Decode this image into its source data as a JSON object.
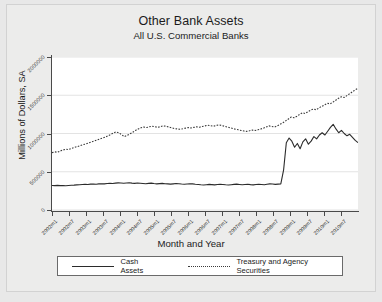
{
  "chart_data": {
    "type": "line",
    "title": "Other Bank Assets",
    "subtitle": "All U.S. Commercial Banks",
    "xlabel": "Month and Year",
    "ylabel": "Millions of Dollars, SA",
    "ylim": [
      0,
      2000000
    ],
    "ytick_labels": [
      "0",
      "500000",
      "1000000",
      "1500000",
      "2000000"
    ],
    "ytick_values": [
      0,
      500000,
      1000000,
      1500000,
      2000000
    ],
    "grid": true,
    "legend_position": "bottom",
    "xtick_labels": [
      "2002m1",
      "2002m7",
      "2003m1",
      "2003m7",
      "2004m1",
      "2004m7",
      "2005m1",
      "2005m7",
      "2006m1",
      "2006m7",
      "2007m1",
      "2007m7",
      "2008m1",
      "2008m7",
      "2009m1",
      "2009m7",
      "2010m1",
      "2010m7"
    ],
    "xtick_values": [
      0,
      6,
      12,
      18,
      24,
      30,
      36,
      42,
      48,
      54,
      60,
      66,
      72,
      78,
      84,
      90,
      96,
      102
    ],
    "x_range": [
      0,
      108
    ],
    "series": [
      {
        "name": "Cash Assets",
        "style": "solid",
        "color": "#2b2b2b",
        "values": [
          320000,
          318000,
          322000,
          319000,
          321000,
          317000,
          320000,
          323000,
          325000,
          328000,
          331000,
          334000,
          336000,
          333000,
          338000,
          340000,
          337000,
          341000,
          344000,
          342000,
          346000,
          349000,
          347000,
          351000,
          354000,
          352000,
          349000,
          353000,
          356000,
          351000,
          348000,
          352000,
          350000,
          347000,
          344000,
          348000,
          351000,
          346000,
          342000,
          345000,
          348000,
          344000,
          341000,
          338000,
          342000,
          346000,
          343000,
          339000,
          336000,
          340000,
          344000,
          341000,
          337000,
          334000,
          330000,
          327000,
          331000,
          335000,
          332000,
          328000,
          333000,
          337000,
          334000,
          330000,
          327000,
          331000,
          335000,
          338000,
          334000,
          330000,
          333000,
          336000,
          332000,
          329000,
          333000,
          337000,
          334000,
          330000,
          336000,
          342000,
          339000,
          335000,
          338000,
          341000,
          520000,
          880000,
          940000,
          900000,
          820000,
          870000,
          800000,
          890000,
          930000,
          860000,
          900000,
          960000,
          930000,
          980000,
          1010000,
          980000,
          1030000,
          1080000,
          1120000,
          1060000,
          1010000,
          1040000,
          1000000,
          970000,
          990000,
          950000,
          910000,
          880000
        ]
      },
      {
        "name": "Treasury and Agency Securities",
        "style": "dotted",
        "color": "#3a3a3a",
        "values": [
          750000,
          760000,
          755000,
          772000,
          785000,
          795000,
          790000,
          805000,
          818000,
          828000,
          840000,
          852000,
          862000,
          875000,
          888000,
          900000,
          912000,
          925000,
          938000,
          950000,
          968000,
          985000,
          1005000,
          1020000,
          1010000,
          985000,
          960000,
          975000,
          995000,
          1015000,
          1040000,
          1060000,
          1075000,
          1085000,
          1078000,
          1088000,
          1095000,
          1088000,
          1080000,
          1090000,
          1100000,
          1095000,
          1085000,
          1075000,
          1065000,
          1060000,
          1055000,
          1062000,
          1070000,
          1078000,
          1072000,
          1080000,
          1088000,
          1082000,
          1092000,
          1100000,
          1108000,
          1102000,
          1095000,
          1105000,
          1112000,
          1105000,
          1095000,
          1085000,
          1075000,
          1065000,
          1055000,
          1048000,
          1040000,
          1032000,
          1028000,
          1035000,
          1045000,
          1040000,
          1048000,
          1058000,
          1070000,
          1085000,
          1100000,
          1092000,
          1085000,
          1100000,
          1120000,
          1140000,
          1165000,
          1190000,
          1215000,
          1205000,
          1225000,
          1250000,
          1270000,
          1262000,
          1285000,
          1305000,
          1320000,
          1310000,
          1335000,
          1355000,
          1375000,
          1395000,
          1388000,
          1410000,
          1435000,
          1460000,
          1480000,
          1470000,
          1495000,
          1520000,
          1545000,
          1570000,
          1590000
        ]
      }
    ]
  }
}
